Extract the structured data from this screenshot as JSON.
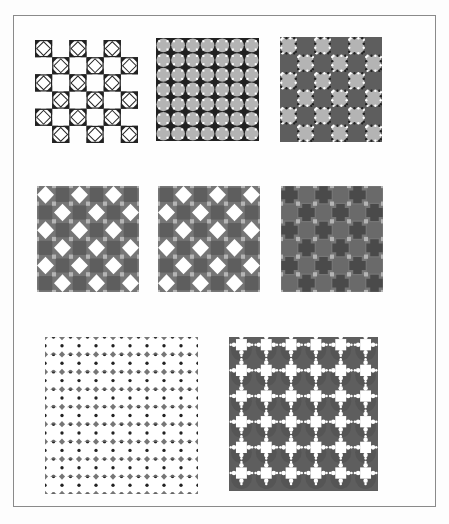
{
  "figure": {
    "frame": {
      "left": 13,
      "top": 15,
      "width": 423,
      "height": 492,
      "border_color": "#8a8a8a"
    },
    "colors": {
      "white": "#ffffff",
      "black": "#222222",
      "dark_gray": "#5e5e5e",
      "mid_gray": "#767676",
      "light_gray": "#b4b4b4"
    },
    "panels": [
      {
        "id": "p1",
        "name": "checker-diamond-outline",
        "x": 35,
        "y": 40,
        "w": 103,
        "h": 103,
        "grid": 6,
        "style": "checker-diamond"
      },
      {
        "id": "p2",
        "name": "gray-octagons-black-stars",
        "x": 156,
        "y": 38,
        "w": 103,
        "h": 103,
        "grid": 7,
        "style": "octagon-star"
      },
      {
        "id": "p3",
        "name": "dark-checker-gray-studded-squares",
        "x": 280,
        "y": 37,
        "w": 102,
        "h": 105,
        "grid": 6,
        "style": "studded-checker"
      },
      {
        "id": "p4",
        "name": "dark-checker-white-diamonds-a",
        "x": 37,
        "y": 186,
        "w": 102,
        "h": 106,
        "grid": 6,
        "style": "diamond-checker",
        "offset": 0
      },
      {
        "id": "p5",
        "name": "dark-checker-white-diamonds-b",
        "x": 158,
        "y": 186,
        "w": 102,
        "h": 106,
        "grid": 6,
        "style": "diamond-checker",
        "offset": 1
      },
      {
        "id": "p6",
        "name": "dark-checker-dark-crosses",
        "x": 281,
        "y": 186,
        "w": 102,
        "h": 106,
        "grid": 6,
        "style": "dark-cross"
      },
      {
        "id": "p7",
        "name": "white-circles-diagonal-chain",
        "x": 45,
        "y": 337,
        "w": 153,
        "h": 157,
        "grid": 9,
        "style": "circle-chain"
      },
      {
        "id": "p8",
        "name": "white-crosses-on-dark",
        "x": 229,
        "y": 337,
        "w": 149,
        "h": 154,
        "grid": 6,
        "style": "white-cross"
      }
    ]
  }
}
